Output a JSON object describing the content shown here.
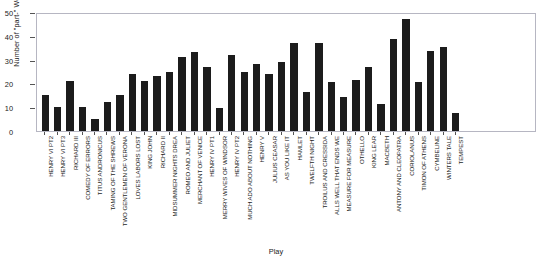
{
  "chart_data": {
    "type": "bar",
    "title": "",
    "xlabel": "Play",
    "ylabel": "Number of \"part-\" Words",
    "ylim": [
      0,
      50
    ],
    "yticks": [
      0,
      10,
      20,
      30,
      40,
      50
    ],
    "grid": false,
    "legend": null,
    "bar_color": "#1c1c1c",
    "categories": [
      "HENRY VI PT2",
      "HENRY VI PT3",
      "RICHARD III",
      "COMEDY OF ERRORS",
      "TITUS ANDRONICUS",
      "TAMING OF THE SHREWS",
      "TWO GENTLEMEN OF VERONA",
      "LOVES LABORS LOST",
      "KING JOHN",
      "RICHARD II",
      "MIDSUMMER NIGHTS DREA",
      "ROMEO AND JULIET",
      "MERCHANT OF VENICE",
      "HENRY IV PT1",
      "MERRY WIVES OF WINDSOR",
      "HENRY IV PT2",
      "MUCH ADO ABOUT NOTHING",
      "HENRY V",
      "JULIUS CEASAR",
      "AS YOU LIKE IT",
      "HAMLET",
      "TWELFTH NIGHT",
      "TROILUS AND CRESSIDA",
      "ALLS WELL THAT ENDS WE",
      "MEASURE FOR MEASURE",
      "OTHELLO",
      "KING LEAR",
      "MACBETH",
      "ANTONY AND CLEOPATRA",
      "CORIOLANUS",
      "TIMON OF ATHENS",
      "CYMBELINE",
      "WINTERS TALE",
      "TEMPEST"
    ],
    "values": [
      15,
      10,
      21,
      10,
      5,
      12,
      15,
      24,
      21,
      23,
      25,
      31,
      33,
      27,
      9.5,
      32,
      25,
      28,
      24,
      29,
      37,
      16.5,
      37,
      20.5,
      14.5,
      21.5,
      27,
      11.5,
      38.5,
      47,
      20.5,
      33.5,
      35.5,
      7.5
    ]
  }
}
